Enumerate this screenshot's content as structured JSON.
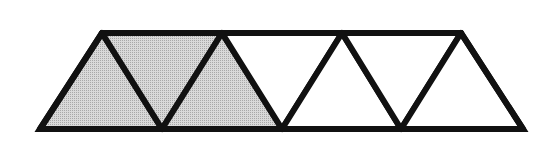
{
  "figure": {
    "total_triangles": 5,
    "shaded_triangles": 2,
    "fill_shaded": "#c8c8c8",
    "fill_unshaded": "#ffffff",
    "stroke": "#111111",
    "stroke_width": 6
  },
  "triangles": [
    {
      "id": 1,
      "orientation": "up",
      "shaded": true,
      "points": "40,129 102,33 162,129"
    },
    {
      "id": 2,
      "orientation": "down",
      "shaded": true,
      "points": "102,33 222,33 162,129"
    },
    {
      "id": 3,
      "orientation": "up",
      "shaded": true,
      "points": "162,129 222,33 282,129"
    },
    {
      "id": 4,
      "orientation": "down",
      "shaded": false,
      "points": "222,33 342,33 282,129"
    },
    {
      "id": 5,
      "orientation": "up",
      "shaded": false,
      "points": "282,129 342,33 401,129"
    },
    {
      "id": 6,
      "orientation": "down",
      "shaded": false,
      "points": "342,33 461,33 401,129"
    },
    {
      "id": 7,
      "orientation": "up",
      "shaded": false,
      "points": "401,129 461,33 523,129"
    }
  ]
}
